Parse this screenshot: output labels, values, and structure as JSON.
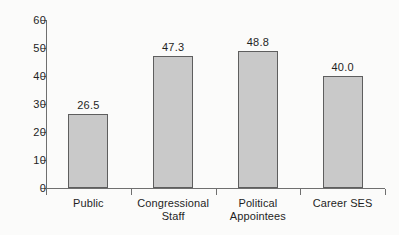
{
  "chart_data": {
    "type": "bar",
    "title": "",
    "subtitle": "",
    "xlabel": "",
    "ylabel": "",
    "categories": [
      "Public",
      "Congressional Staff",
      "Political Appointees",
      "Career SES"
    ],
    "category_lines": [
      [
        "Public"
      ],
      [
        "Congressional",
        "Staff"
      ],
      [
        "Political",
        "Appointees"
      ],
      [
        "Career SES"
      ]
    ],
    "values": [
      26.5,
      47.3,
      48.8,
      40.0
    ],
    "value_labels": [
      "26.5",
      "47.3",
      "48.8",
      "40.0"
    ],
    "ylim": [
      0,
      60
    ],
    "ytick_values": [
      0,
      10,
      20,
      30,
      40,
      50,
      60
    ],
    "ytick_labels": [
      "0",
      "10",
      "20",
      "30",
      "40",
      "50",
      "60"
    ],
    "grid": false,
    "legend": null,
    "legend_position": "none",
    "bar_fill_color": "#c9c9c9",
    "bar_border_color": "#5e5e5e",
    "axis_color": "#6f6f6f",
    "background_color": "#fbfbfa",
    "text_color": "#1f1f1f"
  },
  "artifacts": {
    "mark_a": "",
    "mark_b": "",
    "mark_c": ""
  }
}
